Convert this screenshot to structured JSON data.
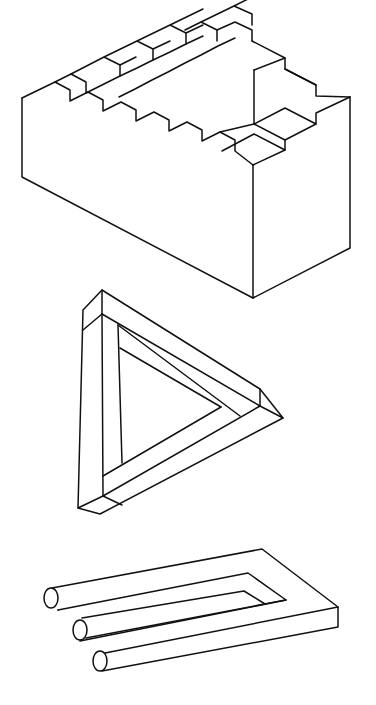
{
  "figures": [
    {
      "id": "penrose-stairs",
      "label": "impossible staircase"
    },
    {
      "id": "penrose-triangle",
      "label": "impossible triangle"
    },
    {
      "id": "blivet",
      "label": "impossible fork"
    }
  ],
  "colors": {
    "background": "#ffffff",
    "stroke": "#111111"
  }
}
